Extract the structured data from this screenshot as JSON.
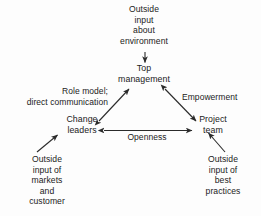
{
  "diagram": {
    "background_color": "#fdfdfd",
    "stroke_color": "#2b2b2b",
    "text_color": "#222222",
    "nodes": [
      {
        "id": "top_management",
        "label": "Top\nmanagement"
      },
      {
        "id": "change_leaders",
        "label": "Change\nleaders"
      },
      {
        "id": "project_team",
        "label": "Project\nteam"
      }
    ],
    "external_inputs": [
      {
        "id": "outside_environment",
        "label": "Outside\ninput\nabout\nenvironment",
        "target": "top_management",
        "arrow": "single-down"
      },
      {
        "id": "outside_markets",
        "label": "Outside\ninput of\nmarkets\nand\ncustomer",
        "target": "change_leaders",
        "arrow": "single-up-right"
      },
      {
        "id": "outside_best_practices",
        "label": "Outside\ninput of\nbest\npractices",
        "target": "project_team",
        "arrow": "single-up-left"
      }
    ],
    "edges": [
      {
        "id": "role_model_edge",
        "label": "Role model;\ndirect communication",
        "from": "change_leaders",
        "to": "top_management",
        "arrow": "double"
      },
      {
        "id": "empowerment_edge",
        "label": "Empowerment",
        "from": "top_management",
        "to": "project_team",
        "arrow": "double"
      },
      {
        "id": "openness_edge",
        "label": "Openness",
        "from": "change_leaders",
        "to": "project_team",
        "arrow": "double"
      }
    ]
  }
}
